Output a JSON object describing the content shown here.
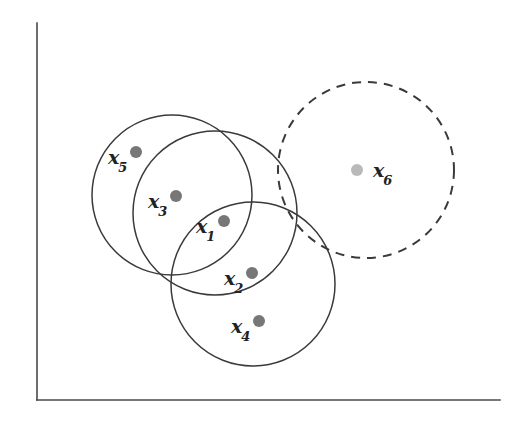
{
  "figure": {
    "background_color": "#ffffff",
    "width": 531,
    "height": 424
  },
  "axes": {
    "name": "l-shaped-axes",
    "color": "#4a4a4a",
    "stroke_width": 1.6,
    "vertical": {
      "x": 37,
      "y_top": 23,
      "y_bottom": 400
    },
    "horizontal": {
      "y": 400,
      "x_left": 37,
      "x_right": 500
    }
  },
  "chart_data": {
    "type": "scatter",
    "title": "",
    "xlabel": "",
    "ylabel": "",
    "grid": false,
    "legend": null,
    "xlim": [
      37,
      500
    ],
    "ylim": [
      400,
      23
    ],
    "points": [
      {
        "label": "x",
        "subscript": "1",
        "x": 224,
        "y": 221,
        "radius": 6.0,
        "color": "#777777",
        "label_x": 196,
        "label_y": 226
      },
      {
        "label": "x",
        "subscript": "2",
        "x": 252,
        "y": 273,
        "radius": 6.0,
        "color": "#777777",
        "label_x": 224,
        "label_y": 278
      },
      {
        "label": "x",
        "subscript": "3",
        "x": 176,
        "y": 196,
        "radius": 6.0,
        "color": "#777777",
        "label_x": 148,
        "label_y": 201
      },
      {
        "label": "x",
        "subscript": "4",
        "x": 259,
        "y": 321,
        "radius": 6.0,
        "color": "#777777",
        "label_x": 231,
        "label_y": 326
      },
      {
        "label": "x",
        "subscript": "5",
        "x": 136,
        "y": 152,
        "radius": 6.0,
        "color": "#777777",
        "label_x": 108,
        "label_y": 157
      },
      {
        "label": "x",
        "subscript": "6",
        "x": 357,
        "y": 170,
        "radius": 6.0,
        "color": "#b9b9b9",
        "label_x": 373,
        "label_y": 170
      }
    ],
    "circles": [
      {
        "name": "circle-around-x5",
        "cx": 172,
        "cy": 195,
        "r": 80,
        "style": "solid",
        "stroke": "#3a3a3a",
        "stroke_width": 1.5
      },
      {
        "name": "circle-around-x3",
        "cx": 215,
        "cy": 213,
        "r": 82,
        "style": "solid",
        "stroke": "#3a3a3a",
        "stroke_width": 1.5
      },
      {
        "name": "circle-around-x1",
        "cx": 253,
        "cy": 284,
        "r": 82,
        "style": "solid",
        "stroke": "#3a3a3a",
        "stroke_width": 1.5
      },
      {
        "name": "circle-around-x6",
        "cx": 366,
        "cy": 170,
        "r": 88,
        "style": "dashed",
        "stroke": "#3a3a3a",
        "stroke_width": 2.0,
        "dash": "9 7"
      }
    ]
  }
}
